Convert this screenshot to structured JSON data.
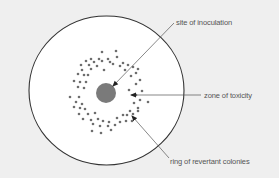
{
  "diagram": {
    "type": "petri-dish-ames-test",
    "colors": {
      "background": "#efefef",
      "dish_fill": "#ffffff",
      "dish_stroke": "#333333",
      "inoculation_fill": "#7a7a7a",
      "colony_fill": "#6e6e6e",
      "line": "#555555",
      "text": "#555555"
    },
    "dish": {
      "cx": 106.5,
      "cy": 90.5,
      "rx": 77.5,
      "ry": 74.5
    },
    "inoculation_site": {
      "cx": 106,
      "cy": 93,
      "r": 10
    },
    "labels": {
      "site_of_inoculation": "site of inoculation",
      "zone_of_toxicity": "zone of toxicity",
      "ring_of_revertant_colonies": "ring of revertant colonies"
    },
    "arrows": [
      {
        "label": "site of inoculation",
        "from": [
          174,
          23
        ],
        "to": [
          113,
          86
        ]
      },
      {
        "label": "zone of toxicity",
        "from": [
          201,
          95
        ],
        "to": [
          131,
          95
        ]
      },
      {
        "label": "ring of revertant colonies",
        "from": [
          169,
          158
        ],
        "to": [
          132,
          116
        ]
      }
    ],
    "colonies": [
      [
        102,
        52
      ],
      [
        116,
        51
      ],
      [
        91,
        59
      ],
      [
        99,
        59
      ],
      [
        108,
        59
      ],
      [
        117,
        57
      ],
      [
        86,
        61
      ],
      [
        94,
        62
      ],
      [
        102,
        61
      ],
      [
        110,
        62
      ],
      [
        123,
        63
      ],
      [
        81,
        65
      ],
      [
        89,
        65
      ],
      [
        97,
        66
      ],
      [
        113,
        64
      ],
      [
        128,
        65
      ],
      [
        82,
        70
      ],
      [
        91,
        69
      ],
      [
        104,
        70
      ],
      [
        120,
        66
      ],
      [
        133,
        67
      ],
      [
        78,
        74
      ],
      [
        84,
        75
      ],
      [
        88,
        75
      ],
      [
        125,
        70
      ],
      [
        136,
        73
      ],
      [
        138,
        69
      ],
      [
        131,
        76
      ],
      [
        140,
        80
      ],
      [
        74,
        81
      ],
      [
        80,
        82
      ],
      [
        86,
        82
      ],
      [
        78,
        87
      ],
      [
        84,
        88
      ],
      [
        136,
        84
      ],
      [
        129,
        90
      ],
      [
        142,
        91
      ],
      [
        70,
        97
      ],
      [
        79,
        97
      ],
      [
        76,
        102
      ],
      [
        82,
        104
      ],
      [
        136,
        95
      ],
      [
        140,
        100
      ],
      [
        148,
        102
      ],
      [
        74,
        107
      ],
      [
        80,
        108
      ],
      [
        85,
        109
      ],
      [
        134,
        103
      ],
      [
        138,
        108
      ],
      [
        79,
        114
      ],
      [
        88,
        114
      ],
      [
        95,
        113
      ],
      [
        130,
        111
      ],
      [
        138,
        111
      ],
      [
        83,
        119
      ],
      [
        91,
        120
      ],
      [
        98,
        119
      ],
      [
        103,
        121
      ],
      [
        109,
        122
      ],
      [
        117,
        118
      ],
      [
        123,
        115
      ],
      [
        127,
        115
      ],
      [
        133,
        114
      ],
      [
        93,
        124
      ],
      [
        100,
        126
      ],
      [
        108,
        126
      ],
      [
        115,
        125
      ],
      [
        120,
        122
      ],
      [
        126,
        121
      ],
      [
        92,
        131
      ],
      [
        101,
        133
      ],
      [
        111,
        130
      ],
      [
        132,
        121
      ]
    ]
  }
}
